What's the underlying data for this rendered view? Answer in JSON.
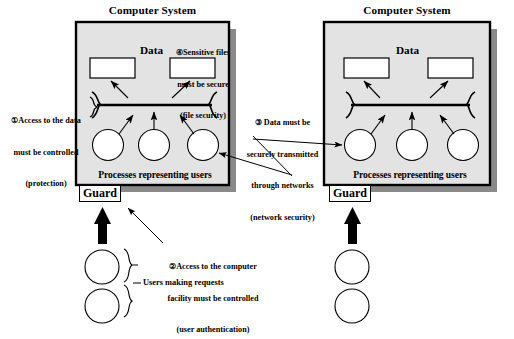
{
  "diagram": {
    "title_left": "Computer System",
    "title_right": "Computer System",
    "data_label_left": "Data",
    "data_label_right": "Data",
    "processes_label_left": "Processes representing users",
    "processes_label_right": "Processes representing users",
    "guard_label_left": "Guard",
    "guard_label_right": "Guard",
    "users_making_requests": "Users making requests"
  },
  "annotations": [
    {
      "id": "1",
      "marker": "①",
      "lines": [
        "Access to the data",
        "must be controlled",
        "(protection)"
      ],
      "full_text": "① Access to the data must be controlled (protection)"
    },
    {
      "id": "2",
      "marker": "②",
      "lines": [
        "Access to the computer",
        "facility must be controlled",
        "(user authentication)"
      ],
      "full_text": "② Access to the computer facility must be controlled (user authentication)"
    },
    {
      "id": "3",
      "marker": "③",
      "lines": [
        "Data must be",
        "securely transmitted",
        "through networks",
        "(network security)"
      ],
      "full_text": "③ Data must be securely transmitted through networks (network security)"
    },
    {
      "id": "4",
      "marker": "④",
      "lines": [
        "Sensitive files",
        "must be secure",
        "(file security)"
      ],
      "full_text": "④ Sensitive files must be secure (file security)"
    }
  ],
  "annotation_lines": {
    "a1_l1": "①Access to the data",
    "a1_l2": "must be controlled",
    "a1_l3": "(protection)",
    "a2_l1": "②Access to the computer",
    "a2_l2": "facility must be controlled",
    "a2_l3": "(user authentication)",
    "a3_l1": "③ Data must be",
    "a3_l2": "securely transmitted",
    "a3_l3": "through networks",
    "a3_l4": "(network security)",
    "a4_l1": "④Sensitive files",
    "a4_l2": "must be secure",
    "a4_l3": "(file security)"
  },
  "colors": {
    "system_fill": "#e3e3e3",
    "system_border": "#000000",
    "shadow": "#8a8a8a",
    "file_fill": "#ffffff",
    "stroke": "#000000",
    "page_bg": "#ffffff"
  },
  "counts": {
    "systems": 2,
    "files_per_system": 2,
    "processes_per_system": 3,
    "external_users_left": 2,
    "external_users_right": 2
  }
}
